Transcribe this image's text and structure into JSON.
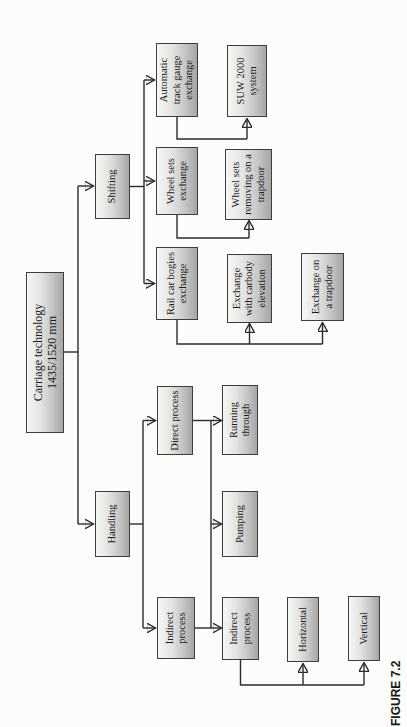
{
  "figure": {
    "caption": "FIGURE 7.2"
  },
  "nodes": {
    "root": {
      "lines": [
        "Carriage technology",
        "1435/1520 mm"
      ]
    },
    "shifting": {
      "lines": [
        "Shifting"
      ]
    },
    "handling": {
      "lines": [
        "Handling"
      ]
    },
    "automatic_track_gauge_exchange": {
      "lines": [
        "Automatic",
        "track gauge",
        "exchange"
      ]
    },
    "wheel_sets_exchange": {
      "lines": [
        "Wheel sets",
        "exchange"
      ]
    },
    "rail_car_bogies_exchange": {
      "lines": [
        "Rail car bogies",
        "exchange"
      ]
    },
    "direct_process": {
      "lines": [
        "Direct process"
      ]
    },
    "indirect_process": {
      "lines": [
        "Indirect",
        "process"
      ]
    },
    "suw_2000_system": {
      "lines": [
        "SUW 2000",
        "system"
      ]
    },
    "wheel_sets_removing_trapdoor": {
      "lines": [
        "Wheel sets",
        "removing on a",
        "trapdoor"
      ]
    },
    "exchange_carbody_elevation": {
      "lines": [
        "Exchange",
        "with carbody",
        "elevation"
      ]
    },
    "running_through": {
      "lines": [
        "Running",
        "through"
      ]
    },
    "pumping": {
      "lines": [
        "Pumping"
      ]
    },
    "indirect_process_sub": {
      "lines": [
        "Indirect",
        "process"
      ]
    },
    "exchange_on_trapdoor": {
      "lines": [
        "Exchange on",
        "a trapdoor"
      ]
    },
    "horizontal": {
      "lines": [
        "Horizontal"
      ]
    },
    "vertical": {
      "lines": [
        "Vertical"
      ]
    }
  },
  "colors": {
    "box_fill_top": "#f6f6f4",
    "box_fill_bottom": "#a5a5a3",
    "box_border": "#3e3e3e",
    "connector_line": "#2b2b2b",
    "arrowhead": "#1b1b1b",
    "text": "#1b1b1b",
    "page_background": "#fcfcfa"
  }
}
